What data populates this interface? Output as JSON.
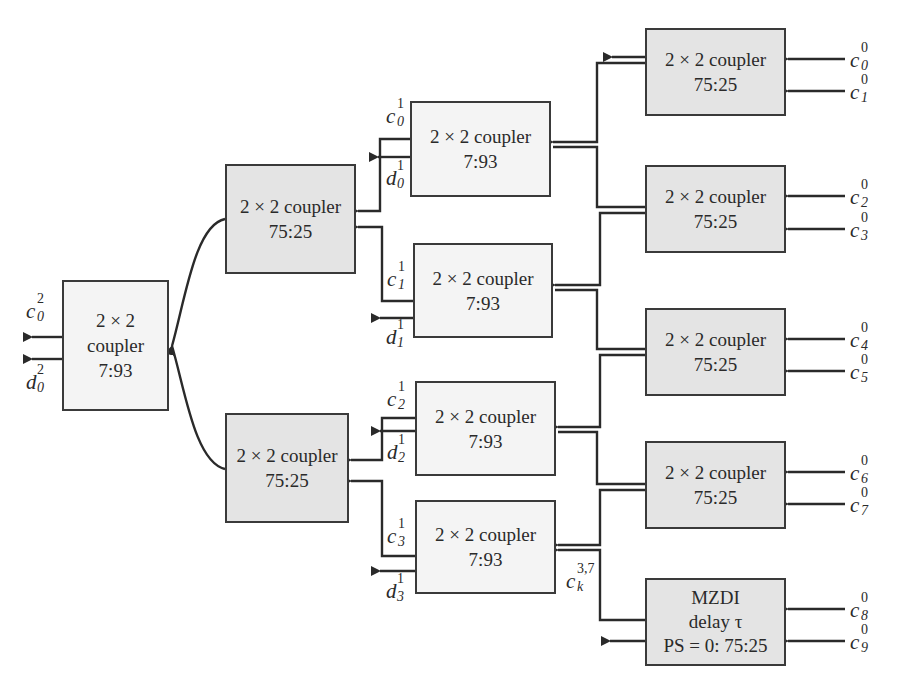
{
  "diagram": {
    "type": "optical coupler tree",
    "final_coupler": {
      "lines": [
        "2 × 2",
        "coupler",
        "7:93"
      ],
      "outputs": [
        "c_0^2",
        "d_0^2"
      ]
    },
    "stage2": [
      {
        "lines": [
          "2 × 2 coupler",
          "75:25"
        ]
      },
      {
        "lines": [
          "2 × 2 coupler",
          "75:25"
        ]
      }
    ],
    "stage1": [
      {
        "lines": [
          "2 × 2 coupler",
          "7:93"
        ],
        "out_c": "c_0^1",
        "out_d": "d_0^1"
      },
      {
        "lines": [
          "2 × 2 coupler",
          "7:93"
        ],
        "out_c": "c_1^1",
        "out_d": "d_1^1"
      },
      {
        "lines": [
          "2 × 2 coupler",
          "7:93"
        ],
        "out_c": "c_2^1",
        "out_d": "d_2^1"
      },
      {
        "lines": [
          "2 × 2 coupler",
          "7:93"
        ],
        "out_c": "c_3^1",
        "out_d": "d_3^1"
      }
    ],
    "stage0": [
      {
        "lines": [
          "2 × 2 coupler",
          "75:25"
        ],
        "inputs": [
          "c_0^0",
          "c_1^0"
        ]
      },
      {
        "lines": [
          "2 × 2 coupler",
          "75:25"
        ],
        "inputs": [
          "c_2^0",
          "c_3^0"
        ]
      },
      {
        "lines": [
          "2 × 2 coupler",
          "75:25"
        ],
        "inputs": [
          "c_4^0",
          "c_5^0"
        ]
      },
      {
        "lines": [
          "2 × 2 coupler",
          "75:25"
        ],
        "inputs": [
          "c_6^0",
          "c_7^0"
        ]
      },
      {
        "lines": [
          "MZDI",
          "delay τ",
          "PS = 0: 75:25"
        ],
        "inputs": [
          "c_8^0",
          "c_9^0"
        ]
      }
    ],
    "labels": {
      "c02": {
        "base": "c",
        "sub": "0",
        "sup": "2"
      },
      "d02": {
        "base": "d",
        "sub": "0",
        "sup": "2"
      },
      "c01": {
        "base": "c",
        "sub": "0",
        "sup": "1"
      },
      "d01": {
        "base": "d",
        "sub": "0",
        "sup": "1"
      },
      "c11": {
        "base": "c",
        "sub": "1",
        "sup": "1"
      },
      "d11": {
        "base": "d",
        "sub": "1",
        "sup": "1"
      },
      "c21": {
        "base": "c",
        "sub": "2",
        "sup": "1"
      },
      "d21": {
        "base": "d",
        "sub": "2",
        "sup": "1"
      },
      "c31": {
        "base": "c",
        "sub": "3",
        "sup": "1"
      },
      "d31": {
        "base": "d",
        "sub": "3",
        "sup": "1"
      },
      "ck37": {
        "base": "c",
        "sub": "k",
        "sup": "3,7"
      },
      "c00": {
        "base": "c",
        "sub": "0",
        "sup": "0"
      },
      "c10": {
        "base": "c",
        "sub": "1",
        "sup": "0"
      },
      "c20": {
        "base": "c",
        "sub": "2",
        "sup": "0"
      },
      "c30": {
        "base": "c",
        "sub": "3",
        "sup": "0"
      },
      "c40": {
        "base": "c",
        "sub": "4",
        "sup": "0"
      },
      "c50": {
        "base": "c",
        "sub": "5",
        "sup": "0"
      },
      "c60": {
        "base": "c",
        "sub": "6",
        "sup": "0"
      },
      "c70": {
        "base": "c",
        "sub": "7",
        "sup": "0"
      },
      "c80": {
        "base": "c",
        "sub": "8",
        "sup": "0"
      },
      "c90": {
        "base": "c",
        "sub": "9",
        "sup": "0"
      }
    },
    "colors": {
      "line": "#2a2a2a",
      "box_dark": "#e4e4e4",
      "box_light": "#f4f4f4",
      "border": "#3a3a3a"
    }
  }
}
